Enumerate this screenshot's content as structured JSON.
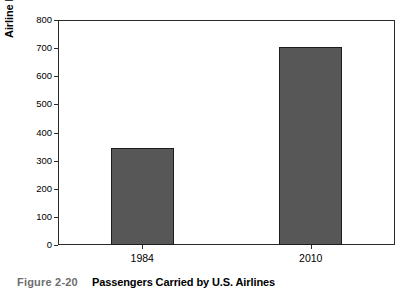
{
  "caption": {
    "figure_number": "Figure 2-20",
    "title": "Passengers Carried by U.S. Airlines"
  },
  "chart_data": {
    "type": "bar",
    "title": "Passengers Carried by U.S. Airlines",
    "xlabel": "",
    "ylabel": "Airline Passengers Carried (millions)",
    "categories": [
      "1984",
      "2010"
    ],
    "values": [
      345,
      705
    ],
    "ylim": [
      0,
      800
    ],
    "ytick_step": 100,
    "yticks": [
      "800",
      "700",
      "600",
      "500",
      "400",
      "300",
      "200",
      "100",
      "0"
    ],
    "grid": false,
    "legend": false,
    "bar_fill_color": "#575757",
    "bar_border_color": "#1c1c1c",
    "axis_color": "#2b2b2b",
    "background_color": "#ffffff"
  }
}
